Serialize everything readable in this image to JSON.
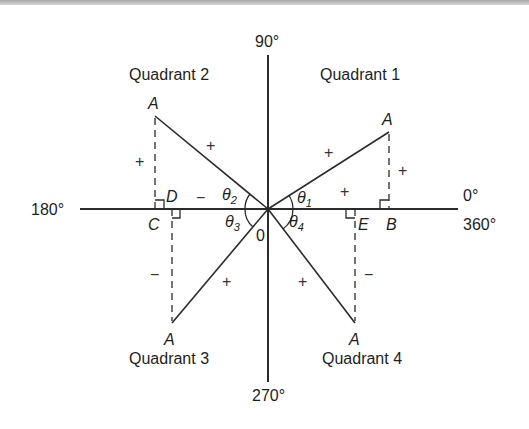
{
  "diagram": {
    "axes": {
      "top": "90°",
      "left": "180°",
      "right_top": "0°",
      "right_bottom": "360°",
      "bottom": "270°",
      "origin": "0"
    },
    "quadrants": [
      {
        "id": 1,
        "label": "Quadrant 1",
        "point": "A",
        "foot": "B",
        "angle_symbol": "θ",
        "angle_sub": "1",
        "hyp_sign": "+",
        "opp_sign": "+",
        "adj_sign": "+"
      },
      {
        "id": 2,
        "label": "Quadrant 2",
        "point": "A",
        "foot": "D",
        "foot2": "C",
        "angle_symbol": "θ",
        "angle_sub": "2",
        "hyp_sign": "+",
        "opp_sign": "+",
        "adj_sign": "−"
      },
      {
        "id": 3,
        "label": "Quadrant 3",
        "point": "A",
        "angle_symbol": "θ",
        "angle_sub": "3",
        "hyp_sign": "+",
        "opp_sign": "−"
      },
      {
        "id": 4,
        "label": "Quadrant 4",
        "point": "A",
        "foot": "E",
        "angle_symbol": "θ",
        "angle_sub": "4",
        "hyp_sign": "+",
        "opp_sign": "−"
      }
    ],
    "colors": {
      "line": "#2b2b2b",
      "text": "#1e1e1e",
      "background": "#ffffff"
    }
  }
}
